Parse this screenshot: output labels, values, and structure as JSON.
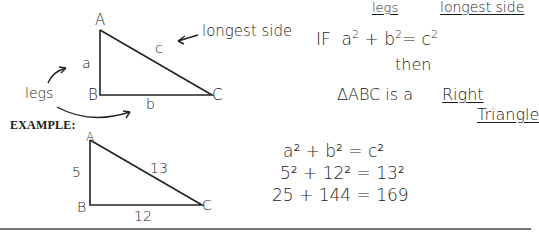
{
  "definition_figure": {
    "vertices": {
      "A": "A",
      "B": "B",
      "C": "C"
    },
    "sides": {
      "a": "a",
      "b": "b",
      "c": "c"
    },
    "label_longest": "longest side",
    "label_legs": "legs"
  },
  "theorem": {
    "legs_note": "legs",
    "longest_note": "longest side",
    "if_text": "IF",
    "equation_lhs_a": "a",
    "equation_lhs_b": "b",
    "equation_rhs_c": "c",
    "exponent": "2",
    "then_text": "then",
    "conclusion_prefix": "ΔABC is a",
    "conclusion_word1": "Right",
    "conclusion_word2": "Triangle"
  },
  "example": {
    "heading": "EXAMPLE:",
    "vertices": {
      "A": "A",
      "B": "B",
      "C": "C"
    },
    "sides": {
      "a": "5",
      "b": "12",
      "c": "13"
    },
    "work": [
      {
        "left": "a",
        "mid": "b",
        "right": "c",
        "exp": "2",
        "line": "a² + b² = c²"
      },
      {
        "line": "5² + 12² = 13²"
      },
      {
        "line": "25  +  144  =  169"
      }
    ]
  }
}
